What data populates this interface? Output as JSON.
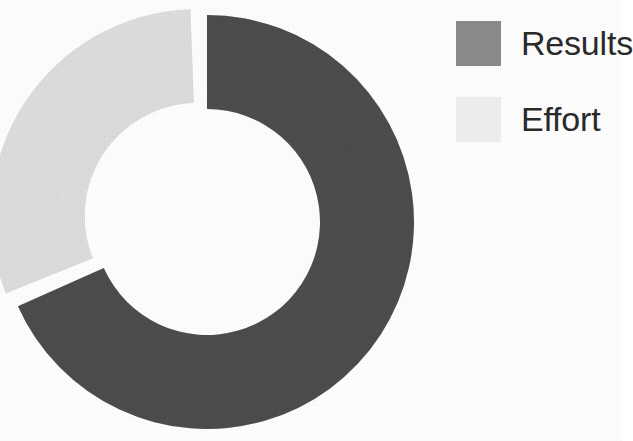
{
  "chart_data": {
    "type": "pie",
    "subtype": "doughnut",
    "title": "",
    "labels": [
      "Results",
      "Effort"
    ],
    "values": [
      68,
      32
    ],
    "unit": "percent",
    "colors": [
      "#8c8c8c",
      "#f0f0f0"
    ],
    "slice_angles_deg": [
      246,
      114
    ],
    "start_angle_deg": 0,
    "direction": "clockwise",
    "hole_ratio": 0.545,
    "exploded_slices": [
      "Effort"
    ],
    "explode_offset_px": 11,
    "legend": {
      "position": "right",
      "entries": [
        {
          "label": "Results",
          "color": "#8c8c8c"
        },
        {
          "label": "Effort",
          "color": "#f0f0f0"
        }
      ]
    },
    "axis": {
      "grid": false,
      "xlabel": "",
      "ylabel": ""
    },
    "data_labels_shown": false,
    "background_color": "#ffffff"
  },
  "chart": {
    "center_x": 207,
    "center_y": 222,
    "outer_radius": 207,
    "inner_radius": 113,
    "segments": [
      {
        "name": "Results",
        "color": "#8c8c8c",
        "start_deg": 0,
        "sweep_deg": 246,
        "explode": 0
      },
      {
        "name": "Effort",
        "color": "#f0f0f0",
        "start_deg": 248,
        "sweep_deg": 110,
        "explode": 11
      }
    ]
  },
  "legend": {
    "items": [
      {
        "label": "Results",
        "color": "#8c8c8c",
        "swatch_name": "legend-swatch-results"
      },
      {
        "label": "Effort",
        "color": "#f0f0f0",
        "swatch_name": "legend-swatch-effort"
      }
    ]
  }
}
